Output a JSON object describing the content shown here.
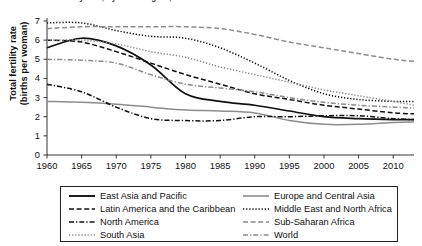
{
  "chart_data": {
    "type": "line",
    "title": "Total fertility rate, by world region, 1960–2013",
    "xlabel": "",
    "ylabel": "Total fertility rate\n(births per woman)",
    "ylabel_line1": "Total fertility rate",
    "ylabel_line2": "(births per woman)",
    "xlim": [
      1960,
      2013
    ],
    "ylim": [
      0,
      7
    ],
    "yticks": [
      0,
      1,
      2,
      3,
      4,
      5,
      6,
      7
    ],
    "xticks": [
      1960,
      1965,
      1970,
      1975,
      1980,
      1985,
      1990,
      1995,
      2000,
      2005,
      2010
    ],
    "grid": false,
    "legend_position": "below-plot",
    "x": [
      1960,
      1965,
      1970,
      1975,
      1980,
      1985,
      1990,
      1995,
      2000,
      2005,
      2010,
      2013
    ],
    "series": [
      {
        "name": "East Asia and Pacific",
        "style": "solid",
        "color": "#111111",
        "values": [
          5.6,
          6.1,
          5.7,
          4.7,
          3.2,
          2.8,
          2.6,
          2.3,
          2.0,
          1.9,
          1.85,
          1.85
        ]
      },
      {
        "name": "Europe and Central Asia",
        "style": "solid",
        "color": "#8c8c8c",
        "values": [
          2.8,
          2.75,
          2.65,
          2.5,
          2.35,
          2.3,
          2.2,
          1.8,
          1.6,
          1.6,
          1.7,
          1.72
        ]
      },
      {
        "name": "Latin America and the Caribbean",
        "style": "dashed",
        "color": "#111111",
        "values": [
          6.0,
          5.9,
          5.4,
          4.8,
          4.2,
          3.7,
          3.2,
          2.9,
          2.6,
          2.4,
          2.2,
          2.15
        ]
      },
      {
        "name": "Middle East and North Africa",
        "style": "dotted",
        "color": "#111111",
        "values": [
          6.9,
          6.9,
          6.5,
          6.2,
          6.1,
          5.6,
          4.8,
          3.9,
          3.2,
          2.9,
          2.8,
          2.8
        ]
      },
      {
        "name": "North America",
        "style": "dashdot",
        "color": "#111111",
        "values": [
          3.7,
          3.3,
          2.5,
          1.9,
          1.8,
          1.8,
          2.0,
          2.0,
          2.05,
          2.05,
          1.9,
          1.85
        ]
      },
      {
        "name": "Sub-Saharan Africa",
        "style": "dashed",
        "color": "#8c8c8c",
        "values": [
          6.6,
          6.7,
          6.7,
          6.7,
          6.7,
          6.6,
          6.3,
          5.9,
          5.6,
          5.3,
          5.0,
          4.9
        ]
      },
      {
        "name": "South Asia",
        "style": "dotted",
        "color": "#8c8c8c",
        "values": [
          6.0,
          6.0,
          5.8,
          5.4,
          5.1,
          4.6,
          4.2,
          3.8,
          3.4,
          3.1,
          2.8,
          2.6
        ]
      },
      {
        "name": "World",
        "style": "dashdot",
        "color": "#8c8c8c",
        "values": [
          5.0,
          4.95,
          4.8,
          4.2,
          3.7,
          3.5,
          3.3,
          3.0,
          2.75,
          2.6,
          2.5,
          2.45
        ]
      }
    ]
  },
  "legend": {
    "items": [
      {
        "label": "East Asia and Pacific",
        "style": "solid",
        "color": "#111111",
        "col": 0,
        "row": 0
      },
      {
        "label": "Latin America and the Caribbean",
        "style": "dashed",
        "color": "#111111",
        "col": 0,
        "row": 1
      },
      {
        "label": "North America",
        "style": "dashdot",
        "color": "#111111",
        "col": 0,
        "row": 2
      },
      {
        "label": "South Asia",
        "style": "dotted",
        "color": "#8c8c8c",
        "col": 0,
        "row": 3
      },
      {
        "label": "Europe and Central Asia",
        "style": "solid",
        "color": "#8c8c8c",
        "col": 1,
        "row": 0
      },
      {
        "label": "Middle East and North Africa",
        "style": "dotted",
        "color": "#111111",
        "col": 1,
        "row": 1
      },
      {
        "label": "Sub-Saharan Africa",
        "style": "dashed",
        "color": "#8c8c8c",
        "col": 1,
        "row": 2
      },
      {
        "label": "World",
        "style": "dashdot",
        "color": "#8c8c8c",
        "col": 1,
        "row": 3
      }
    ]
  },
  "axis": {
    "ytick_labels": [
      "7",
      "6",
      "5",
      "4",
      "3",
      "2",
      "1",
      "0"
    ],
    "xtick_labels": [
      "1960",
      "1965",
      "1970",
      "1975",
      "1980",
      "1985",
      "1990",
      "1995",
      "2000",
      "2005",
      "2010"
    ]
  }
}
